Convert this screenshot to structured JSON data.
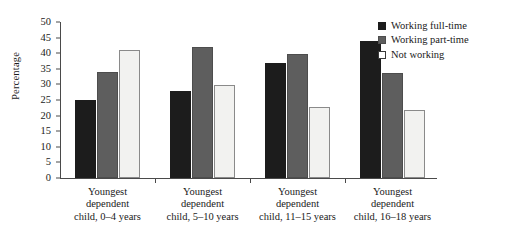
{
  "chart_data": {
    "type": "bar",
    "title": "",
    "xlabel": "",
    "ylabel": "Percentage",
    "ylim": [
      0,
      50
    ],
    "yticks": [
      0,
      5,
      10,
      15,
      20,
      25,
      30,
      35,
      40,
      45,
      50
    ],
    "ytick_labels": [
      "0",
      "5",
      "10",
      "15",
      "20",
      "25",
      "30",
      "35",
      "40",
      "45",
      "50"
    ],
    "grid": false,
    "legend_position": "top-right",
    "categories": [
      "Youngest dependent child, 0–4 years",
      "Youngest dependent child, 5–10 years",
      "Youngest dependent child, 11–15 years",
      "Youngest dependent child, 16–18 years"
    ],
    "category_lines": [
      [
        "Youngest",
        "dependent",
        "child, 0–4 years"
      ],
      [
        "Youngest",
        "dependent",
        "child, 5–10 years"
      ],
      [
        "Youngest",
        "dependent",
        "child, 11–15 years"
      ],
      [
        "Youngest",
        "dependent",
        "child, 16–18 years"
      ]
    ],
    "series": [
      {
        "name": "Working full-time",
        "color": "#1c1c1c",
        "values": [
          25.0,
          27.8,
          36.9,
          43.8
        ]
      },
      {
        "name": "Working part-time",
        "color": "#5e5e5e",
        "values": [
          34.0,
          42.0,
          39.8,
          33.8
        ]
      },
      {
        "name": "Not working",
        "color": "#f2f2f0",
        "values": [
          41.0,
          29.7,
          22.7,
          21.8
        ]
      }
    ]
  },
  "legend": {
    "items": [
      {
        "label": "Working full-time"
      },
      {
        "label": "Working part-time"
      },
      {
        "label": "Not working"
      }
    ]
  }
}
